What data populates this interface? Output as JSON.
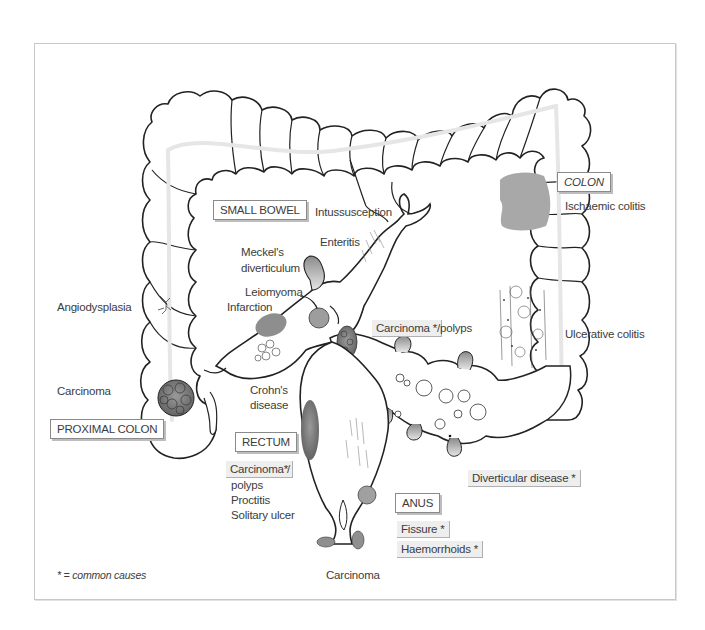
{
  "diagram": {
    "sections": {
      "small_bowel": "SMALL BOWEL",
      "colon": "COLON",
      "proximal_colon": "PROXIMAL COLON",
      "rectum": "RECTUM",
      "anus": "ANUS"
    },
    "labels": {
      "intussusception": "Intussusception",
      "enteritis": "Enteritis",
      "meckels_1": "Meckel's",
      "meckels_2": "diverticulum",
      "leiomyoma": "Leiomyoma",
      "infarction": "Infarction",
      "angiodysplasia": "Angiodysplasia",
      "carcinoma_proximal": "Carcinoma",
      "crohns_1": "Crohn's",
      "crohns_2": "disease",
      "ischaemic_colitis": "Ischaemic colitis",
      "ulcerative_colitis": "Ulcerative colitis",
      "carcinoma_sigmoid": "Carcinoma *",
      "carcinoma_sigmoid_suffix": "/polyps",
      "diverticular_disease": "Diverticular disease *",
      "carcinoma_rectum": "Carcinoma*",
      "carcinoma_rectum_suffix": "/",
      "polyps": "polyps",
      "proctitis": "Proctitis",
      "solitary_ulcer": "Solitary ulcer",
      "fissure": "Fissure *",
      "haemorrhoids": "Haemorrhoids *",
      "carcinoma_anal": "Carcinoma"
    },
    "legend": "* = common causes",
    "colors": {
      "outline": "#222222",
      "lesion_fill": "#a9a9a9",
      "lumen_line": "#e4e4e4",
      "frame": "#c8c8c8",
      "highlight_bg": "#eeeeee"
    }
  }
}
